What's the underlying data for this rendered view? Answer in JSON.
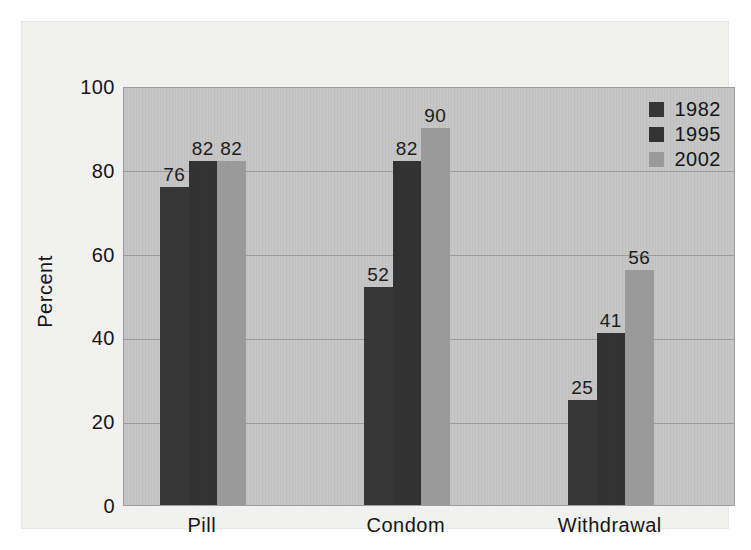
{
  "chart_data": {
    "type": "bar",
    "title": "",
    "xlabel": "",
    "ylabel": "Percent",
    "ylim": [
      0,
      100
    ],
    "yticks": [
      "0",
      "20",
      "40",
      "60",
      "80",
      "100"
    ],
    "grid": true,
    "legend_position": "top-right-inside",
    "categories": [
      "Pill",
      "Condom",
      "Withdrawal"
    ],
    "series": [
      {
        "name": "1982",
        "color": "#373737",
        "values": [
          76,
          52,
          25
        ]
      },
      {
        "name": "1995",
        "color": "#333333",
        "values": [
          82,
          82,
          41
        ]
      },
      {
        "name": "2002",
        "color": "#9b9b9b",
        "values": [
          82,
          90,
          56
        ]
      }
    ],
    "data_labels": [
      [
        "76",
        "82",
        "82"
      ],
      [
        "52",
        "82",
        "90"
      ],
      [
        "25",
        "41",
        "56"
      ]
    ]
  },
  "colors": {
    "page_background": "#f2f2f0",
    "plot_background": "#c6c6c6",
    "gridline": "#9d9d9d",
    "axis_text": "#161616"
  }
}
